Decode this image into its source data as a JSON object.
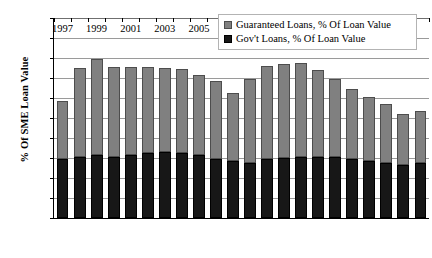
{
  "chart_data": {
    "type": "bar",
    "subtype": "stacked-vertical",
    "title": "",
    "xlabel": "",
    "ylabel": "% Of SME Loan Value",
    "ylim": [
      0,
      30
    ],
    "ytick_labels": [
      "0%",
      "3%",
      "6%",
      "9%",
      "12%",
      "15%",
      "18%",
      "21%",
      "24%",
      "27%",
      "30%"
    ],
    "ytick_values": [
      0,
      3,
      6,
      9,
      12,
      15,
      18,
      21,
      24,
      27,
      30
    ],
    "grid": true,
    "grid_axis": "y",
    "legend_position": "top-right",
    "categories": [
      "1997",
      "1998",
      "1999",
      "2000",
      "2001",
      "2002",
      "2003",
      "2004",
      "2005",
      "2006",
      "2007",
      "2008",
      "2009",
      "2010",
      "2011",
      "2012",
      "2013",
      "2014",
      "2015",
      "2016",
      "2017",
      "2018"
    ],
    "xtick_labels_shown": [
      "1997",
      "1999",
      "2001",
      "2003",
      "2005",
      "2007",
      "2009",
      "2011",
      "2013",
      "2015",
      "2017"
    ],
    "series": [
      {
        "name": "Gov't Loans, % Of Loan Value",
        "color": "#171717",
        "values": [
          8.9,
          9.1,
          9.4,
          9.1,
          9.5,
          9.8,
          9.9,
          9.8,
          9.4,
          8.9,
          8.5,
          8.3,
          8.8,
          9.0,
          9.1,
          9.1,
          9.1,
          8.9,
          8.6,
          8.3,
          7.9,
          8.3
        ]
      },
      {
        "name": "Guaranteed Loans, % Of Loan Value",
        "color": "#808080",
        "values": [
          8.6,
          13.4,
          14.4,
          13.5,
          13.1,
          12.8,
          12.6,
          12.6,
          12.0,
          11.6,
          10.3,
          12.5,
          14.0,
          14.1,
          14.1,
          13.1,
          11.7,
          10.4,
          9.5,
          8.8,
          7.7,
          7.7
        ]
      }
    ],
    "totals": [
      17.5,
      22.5,
      23.8,
      22.6,
      22.6,
      22.6,
      22.5,
      22.4,
      21.4,
      20.5,
      18.8,
      20.8,
      22.8,
      23.1,
      23.2,
      22.2,
      20.8,
      19.3,
      18.1,
      17.1,
      15.6,
      16.0
    ]
  },
  "legend": {
    "items": [
      {
        "label": "Guaranteed Loans, % Of Loan Value",
        "swatch": "guar"
      },
      {
        "label": "Gov't Loans, % Of Loan Value",
        "swatch": "gov"
      }
    ]
  },
  "colors": {
    "guaranteed": "#808080",
    "government": "#171717",
    "gridline": "#9a9a9a",
    "axis": "#000000",
    "background": "#ffffff"
  }
}
